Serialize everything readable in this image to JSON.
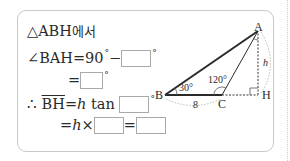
{
  "problem": {
    "line1": {
      "prefix": "△ABH",
      "suffix": "에서"
    },
    "line2": {
      "lhs": "∠BAH",
      "eq": "=",
      "value": "90",
      "minus": "−",
      "blank": "",
      "deg": "°"
    },
    "line3": {
      "eq": "=",
      "blank": "",
      "deg": "°"
    },
    "line4": {
      "therefore": "∴",
      "seg": "BH",
      "eq": "=",
      "h": "h",
      "tan": "tan",
      "blank": "",
      "deg": "°"
    },
    "line5": {
      "eq": "=",
      "h": "h",
      "times": "×",
      "blank1": "",
      "eq2": "=",
      "blank2": ""
    }
  },
  "diagram": {
    "points": {
      "A": "A",
      "B": "B",
      "C": "C",
      "H": "H"
    },
    "angle_B": "30°",
    "angle_C": "120°",
    "side_BC": "8",
    "side_AH": "h",
    "colors": {
      "line": "#2a2a2a",
      "dashed": "#9a9a9a",
      "frame": "#c9c9c9"
    }
  }
}
